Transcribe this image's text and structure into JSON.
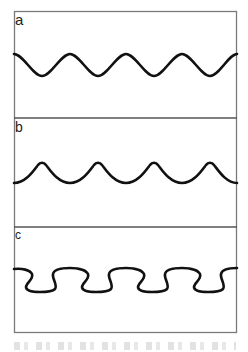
{
  "figure": {
    "panels": [
      {
        "label": "a",
        "wave_type": "sinusoidal"
      },
      {
        "label": "b",
        "wave_type": "trochoidal (sharp crests, broad troughs)"
      },
      {
        "label": "c",
        "wave_type": "overhanging / meandering"
      }
    ],
    "colors": {
      "frame": "#7a7a7a",
      "curve": "#111111",
      "background": "#ffffff"
    },
    "caption": ""
  }
}
